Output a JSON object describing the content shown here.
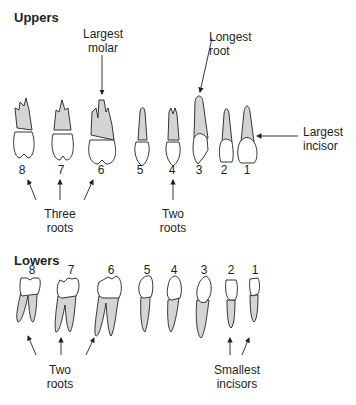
{
  "uppers": {
    "heading": "Uppers",
    "numbers": [
      "8",
      "7",
      "6",
      "5",
      "4",
      "3",
      "2",
      "1"
    ],
    "annotations": {
      "largest_molar": "Largest molar",
      "longest_root": "Longest root",
      "largest_incisor": "Largest incisor",
      "three_roots": "Three roots",
      "two_roots": "Two roots"
    }
  },
  "lowers": {
    "heading": "Lowers",
    "numbers": [
      "8",
      "7",
      "6",
      "5",
      "4",
      "3",
      "2",
      "1"
    ],
    "annotations": {
      "two_roots": "Two roots",
      "smallest_incisors": "Smallest incisors"
    }
  },
  "colors": {
    "root_fill": "#d4d4d4",
    "crown_fill": "#ffffff",
    "stroke": "#231f20"
  }
}
